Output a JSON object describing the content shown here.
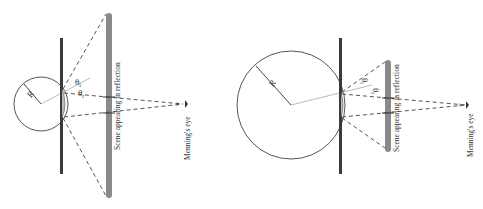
{
  "panels": [
    {
      "id": "left",
      "radius_label": "R",
      "theta_i": "θ",
      "theta_i_sub": "i",
      "theta_r": "θ",
      "theta_r_sub": "r",
      "scene_label": "Scene appearing in reflection",
      "eye_label": "Menning's eye",
      "eye_mark": "="
    },
    {
      "id": "right",
      "radius_label": "R",
      "theta_i": "θ",
      "theta_i_sub": "i",
      "theta_r": "θ",
      "theta_r_sub": "r",
      "scene_label": "Scene appearing in reflection",
      "eye_label": "Menning's eye",
      "eye_mark": "="
    }
  ],
  "colors": {
    "line": "#555555",
    "plate": "#3a3a3a",
    "scene_bar": "#8a8a8a",
    "normal": "#bbbbbb",
    "dash": "#555555"
  }
}
